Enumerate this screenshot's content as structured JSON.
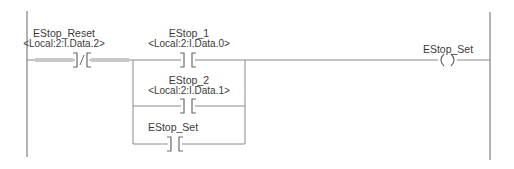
{
  "rung": {
    "instructions": [
      {
        "type": "XIO",
        "symbol": "]/[",
        "tag": "EStop_Reset",
        "address": "<Local:2:I.Data.2>",
        "highlighted": true
      },
      {
        "type": "XIC",
        "symbol": "] [",
        "tag": "EStop_1",
        "address": "<Local:2:I.Data.0>",
        "branch": 0
      },
      {
        "type": "XIC",
        "symbol": "] [",
        "tag": "EStop_2",
        "address": "<Local:2:I.Data.1>",
        "branch": 1
      },
      {
        "type": "XIC",
        "symbol": "] [",
        "tag": "EStop_Set",
        "branch": 2
      },
      {
        "type": "OTE",
        "symbol": "( )",
        "tag": "EStop_Set"
      }
    ]
  },
  "colors": {
    "line": "#8a8a8a",
    "highlight": "#c8c8c8",
    "text": "#3a3a3a"
  }
}
